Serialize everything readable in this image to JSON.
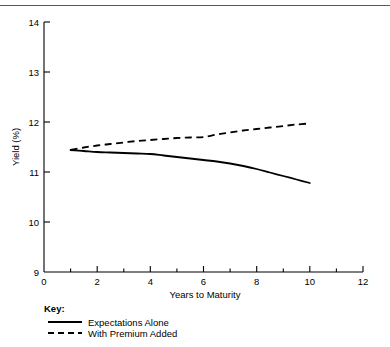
{
  "chart_data": {
    "type": "line",
    "title": "",
    "xlabel": "Years to Maturity",
    "ylabel": "Yield (%)",
    "xlim": [
      0,
      12
    ],
    "ylim": [
      9,
      14
    ],
    "xticks": [
      0,
      2,
      4,
      6,
      8,
      10,
      12
    ],
    "xtick_labels": [
      "0",
      "2",
      "4",
      "6",
      "8",
      "10",
      "12"
    ],
    "xminor_ticks": [
      1,
      3,
      5,
      7,
      9,
      11
    ],
    "yticks": [
      9,
      10,
      11,
      12,
      13,
      14
    ],
    "ytick_labels": [
      "9",
      "10",
      "11",
      "12",
      "13",
      "14"
    ],
    "grid": false,
    "legend_position": "below-left",
    "legend_title": "Key:",
    "series": [
      {
        "name": "Expectations Alone",
        "style": "solid",
        "color": "#000000",
        "x": [
          1.0,
          1.5,
          2.0,
          2.5,
          3.0,
          3.5,
          4.0,
          4.5,
          5.0,
          5.5,
          6.0,
          6.5,
          7.0,
          7.5,
          8.0,
          8.5,
          9.0,
          9.5,
          10.0
        ],
        "values": [
          11.44,
          11.42,
          11.4,
          11.39,
          11.38,
          11.37,
          11.36,
          11.33,
          11.3,
          11.27,
          11.24,
          11.21,
          11.17,
          11.12,
          11.06,
          10.99,
          10.92,
          10.85,
          10.78
        ]
      },
      {
        "name": "With Premium Added",
        "style": "dashed",
        "color": "#000000",
        "x": [
          1.0,
          1.5,
          2.0,
          2.5,
          3.0,
          3.5,
          4.0,
          4.5,
          5.0,
          5.5,
          6.0,
          6.5,
          7.0,
          7.5,
          8.0,
          8.5,
          9.0,
          9.5,
          10.0
        ],
        "values": [
          11.44,
          11.49,
          11.53,
          11.56,
          11.59,
          11.62,
          11.64,
          11.66,
          11.68,
          11.69,
          11.7,
          11.75,
          11.79,
          11.83,
          11.86,
          11.89,
          11.92,
          11.95,
          11.97
        ]
      }
    ]
  },
  "legend": {
    "title": "Key:",
    "items": [
      {
        "label": "Expectations Alone",
        "style": "solid"
      },
      {
        "label": "With Premium Added",
        "style": "dashed"
      }
    ]
  },
  "axes": {
    "x_title": "Years to Maturity",
    "y_title": "Yield (%)"
  },
  "colors": {
    "ink": "#000000",
    "rule": "#58585a",
    "background": "#ffffff"
  }
}
